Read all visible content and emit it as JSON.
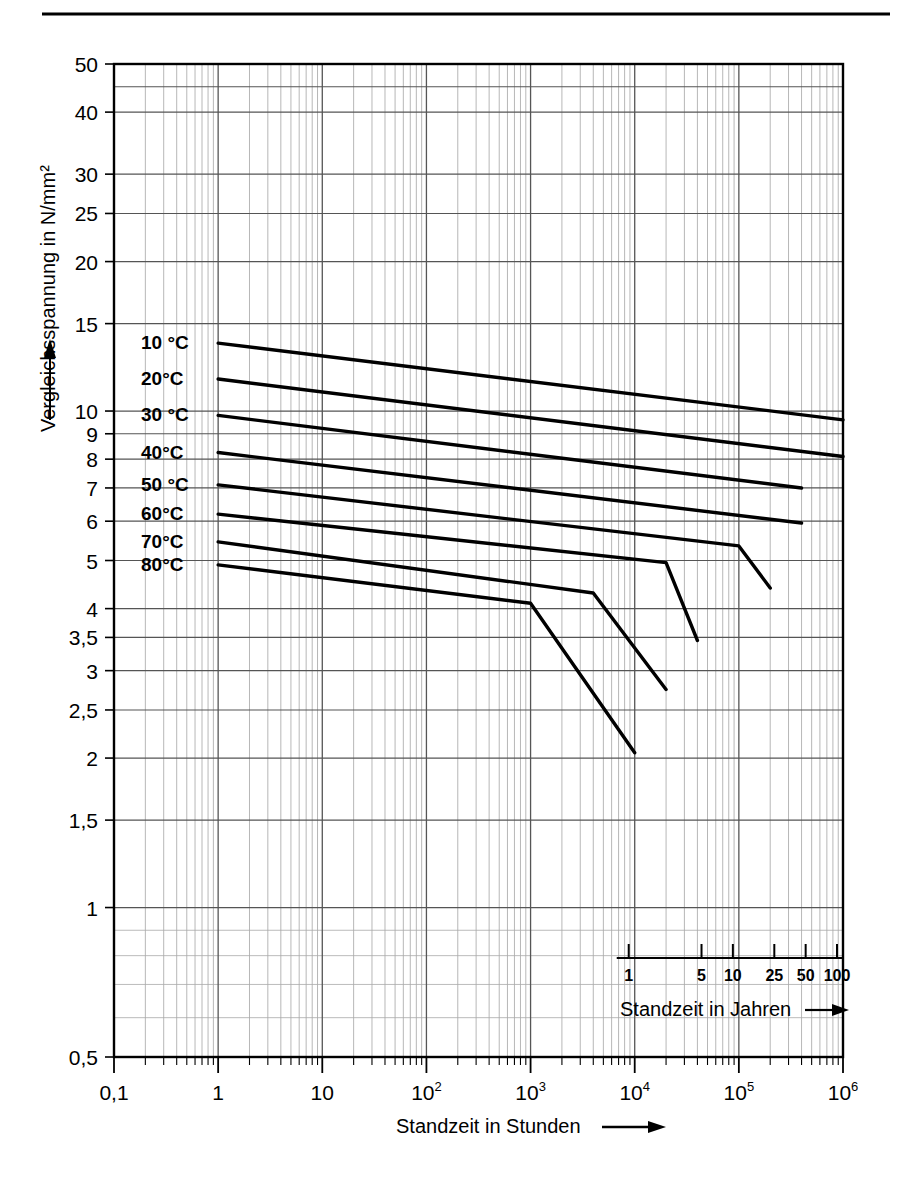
{
  "page": {
    "top_rule": true
  },
  "chart_data": {
    "type": "line",
    "title": "",
    "xlabel": "Standzeit in Stunden",
    "ylabel": "Vergleichsspannung in N/mm²",
    "xscale": "log",
    "yscale": "log",
    "xlim": [
      0.1,
      1000000
    ],
    "ylim": [
      0.5,
      50
    ],
    "grid": true,
    "legend": "inline-labels-left",
    "x_tick_labels": [
      "0,1",
      "1",
      "10",
      "10²",
      "10³",
      "10⁴",
      "10⁵",
      "10⁶"
    ],
    "x_tick_values": [
      0.1,
      1,
      10,
      100,
      1000,
      10000,
      100000,
      1000000
    ],
    "y_tick_labels": [
      "0,5",
      "1",
      "1,5",
      "2",
      "2,5",
      "3",
      "3,5",
      "4",
      "5",
      "6",
      "7",
      "8",
      "9",
      "10",
      "15",
      "20",
      "25",
      "30",
      "40",
      "50"
    ],
    "y_tick_values": [
      0.5,
      1,
      1.5,
      2,
      2.5,
      3,
      3.5,
      4,
      5,
      6,
      7,
      8,
      9,
      10,
      15,
      20,
      25,
      30,
      40,
      50
    ],
    "secondary_axis": {
      "label": "Standzeit in Jahren",
      "tick_labels": [
        "1",
        "5",
        "10",
        "25",
        "50",
        "100"
      ],
      "tick_values_years": [
        1,
        5,
        10,
        25,
        50,
        100
      ],
      "tick_values_hours": [
        8760,
        43800,
        87600,
        219000,
        438000,
        876000
      ],
      "arrow": true
    },
    "series": [
      {
        "name": "10 °C",
        "label": "10 °C",
        "points": [
          [
            1,
            13.7
          ],
          [
            1000000,
            9.6
          ]
        ]
      },
      {
        "name": "20°C",
        "label": "20°C",
        "points": [
          [
            1,
            11.6
          ],
          [
            1000000,
            8.1
          ]
        ]
      },
      {
        "name": "30 °C",
        "label": "30 °C",
        "points": [
          [
            1,
            9.8
          ],
          [
            400000,
            7.0
          ]
        ]
      },
      {
        "name": "40°C",
        "label": "40°C",
        "points": [
          [
            1,
            8.25
          ],
          [
            400000,
            5.95
          ]
        ]
      },
      {
        "name": "50 °C",
        "label": "50 °C",
        "points": [
          [
            1,
            7.1
          ],
          [
            100000,
            5.35
          ],
          [
            200000,
            4.4
          ]
        ]
      },
      {
        "name": "60°C",
        "label": "60°C",
        "points": [
          [
            1,
            6.2
          ],
          [
            20000,
            4.95
          ],
          [
            40000,
            3.45
          ]
        ]
      },
      {
        "name": "70°C",
        "label": "70°C",
        "points": [
          [
            1,
            5.45
          ],
          [
            4000,
            4.3
          ],
          [
            20000,
            2.75
          ]
        ]
      },
      {
        "name": "80°C",
        "label": "80°C",
        "points": [
          [
            1,
            4.9
          ],
          [
            1000,
            4.1
          ],
          [
            10000,
            2.05
          ]
        ]
      }
    ]
  },
  "labels": {
    "x_axis_title": "Standzeit in Stunden",
    "y_axis_title": "Vergleichsspannung in N/mm²",
    "years_axis_title": "Standzeit in Jahren"
  },
  "colors": {
    "curve": "#000000",
    "grid_major": "#555555",
    "grid_minor": "#aaaaaa",
    "frame": "#000000",
    "background": "#ffffff"
  }
}
